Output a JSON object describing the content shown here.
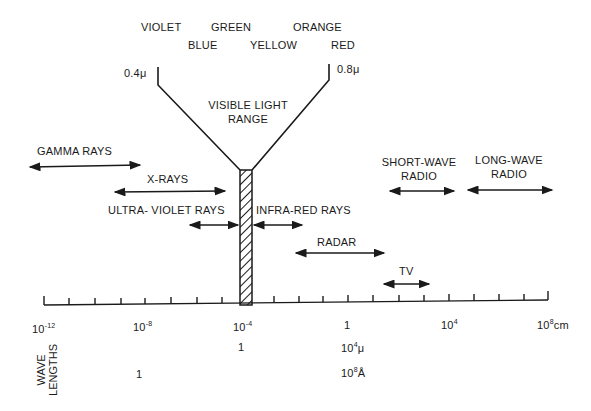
{
  "colors": {
    "top_row": [
      "VIOLET",
      "GREEN",
      "ORANGE"
    ],
    "bottom_row": [
      "BLUE",
      "YELLOW",
      "RED"
    ]
  },
  "visible": {
    "left_bound": "0.4μ",
    "right_bound": "0.8μ",
    "title_line1": "VISIBLE LIGHT",
    "title_line2": "RANGE"
  },
  "bands": {
    "gamma": "GAMMA RAYS",
    "xray": "X-RAYS",
    "uv": "ULTRA- VIOLET RAYS",
    "ir": "INFRA-RED RAYS",
    "radar": "RADAR",
    "tv": "TV",
    "short_wave_1": "SHORT-WAVE",
    "short_wave_2": "RADIO",
    "long_wave_1": "LONG-WAVE",
    "long_wave_2": "RADIO"
  },
  "axis": {
    "ticks_cm": [
      {
        "base": "10",
        "exp": "-12"
      },
      {
        "base": "10",
        "exp": "-8"
      },
      {
        "base": "10",
        "exp": "-4"
      },
      {
        "base": "1",
        "exp": ""
      },
      {
        "base": "10",
        "exp": "4"
      },
      {
        "base": "10",
        "exp": "8",
        "unit": "cm"
      }
    ],
    "micron_row": {
      "at_1e-4": "1",
      "at_1": "10",
      "at_1_exp": "4",
      "unit": "μ"
    },
    "angstrom_row": {
      "at_1e-8": "1",
      "at_1": "10",
      "at_1_exp": "8",
      "unit": "Å"
    },
    "side_label_1": "WAVE",
    "side_label_2": "LENGTHS"
  }
}
